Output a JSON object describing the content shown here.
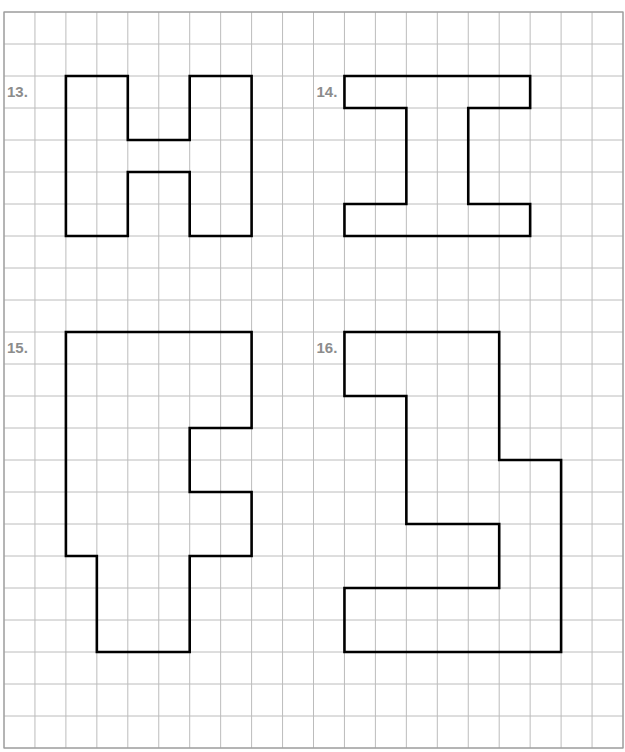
{
  "header": {
    "clipped_text": ""
  },
  "grid": {
    "origin_x": 4,
    "origin_y": 12,
    "cols": 20,
    "rows": 23,
    "cell_w": 30.95,
    "cell_h": 32,
    "line_color": "#bcbcbc",
    "border_color": "#9a9a9a",
    "shape_stroke": "#000000",
    "label_color": "#8c8c8c"
  },
  "problems": [
    {
      "number": "13.",
      "label_pos": [
        0,
        2
      ],
      "shape": "H",
      "outline": [
        [
          2,
          2
        ],
        [
          4,
          2
        ],
        [
          4,
          4
        ],
        [
          6,
          4
        ],
        [
          6,
          2
        ],
        [
          8,
          2
        ],
        [
          8,
          7
        ],
        [
          6,
          7
        ],
        [
          6,
          5
        ],
        [
          4,
          5
        ],
        [
          4,
          7
        ],
        [
          2,
          7
        ]
      ]
    },
    {
      "number": "14.",
      "label_pos": [
        10,
        2
      ],
      "shape": "I",
      "outline": [
        [
          11,
          2
        ],
        [
          17,
          2
        ],
        [
          17,
          3
        ],
        [
          15,
          3
        ],
        [
          15,
          6
        ],
        [
          17,
          6
        ],
        [
          17,
          7
        ],
        [
          11,
          7
        ],
        [
          11,
          6
        ],
        [
          13,
          6
        ],
        [
          13,
          3
        ],
        [
          11,
          3
        ]
      ]
    },
    {
      "number": "15.",
      "label_pos": [
        0,
        10
      ],
      "shape": "polygon",
      "outline": [
        [
          2,
          10
        ],
        [
          8,
          10
        ],
        [
          8,
          13
        ],
        [
          6,
          13
        ],
        [
          6,
          15
        ],
        [
          8,
          15
        ],
        [
          8,
          17
        ],
        [
          6,
          17
        ],
        [
          6,
          20
        ],
        [
          3,
          20
        ],
        [
          3,
          17
        ],
        [
          2,
          17
        ]
      ]
    },
    {
      "number": "16.",
      "label_pos": [
        10,
        10
      ],
      "shape": "polygon",
      "outline": [
        [
          11,
          10
        ],
        [
          16,
          10
        ],
        [
          16,
          14
        ],
        [
          18,
          14
        ],
        [
          18,
          20
        ],
        [
          11,
          20
        ],
        [
          11,
          18
        ],
        [
          16,
          18
        ],
        [
          16,
          16
        ],
        [
          13,
          16
        ],
        [
          13,
          12
        ],
        [
          11,
          12
        ]
      ]
    }
  ]
}
